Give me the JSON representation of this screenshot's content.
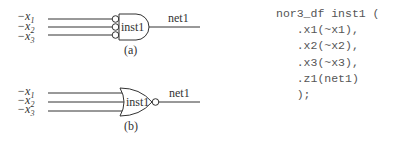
{
  "figure_a": {
    "inputs": [
      "−x1",
      "−x2",
      "−x3"
    ],
    "input_subscripts": [
      "1",
      "2",
      "3"
    ],
    "input_base": "−x",
    "gate_type": "AND with inverted inputs",
    "instance": "inst1",
    "output_net": "net1",
    "caption": "(a)"
  },
  "figure_b": {
    "inputs": [
      "−x1",
      "−x2",
      "−x3"
    ],
    "input_subscripts": [
      "1",
      "2",
      "3"
    ],
    "input_base": "−x",
    "gate_type": "NOR",
    "instance": "inst1",
    "output_net": "net1",
    "caption": "(b)"
  },
  "code": {
    "lines": [
      "nor3_df inst1 (",
      "   .x1(~x1),",
      "   .x2(~x2),",
      "   .x3(~x3),",
      "   .z1(net1)",
      "   );"
    ]
  },
  "colors": {
    "line": "#333333",
    "text": "#333333",
    "code_text": "#555555",
    "background": "#ffffff"
  }
}
